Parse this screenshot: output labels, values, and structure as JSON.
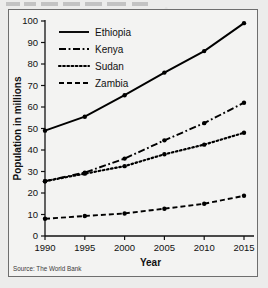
{
  "figure": {
    "source_note": "Source: The World Bank",
    "frame_color": "#6e6e6e",
    "background": "#f3f3f2",
    "line_color": "#000000"
  },
  "chart_data": {
    "type": "line",
    "title": "",
    "xlabel": "Year",
    "ylabel": "Population in millions",
    "x": [
      1990,
      1995,
      2000,
      2005,
      2010,
      2015
    ],
    "categories": [
      "1990",
      "1995",
      "2000",
      "2005",
      "2010",
      "2015"
    ],
    "xlim": [
      1990,
      2015
    ],
    "ylim": [
      0,
      100
    ],
    "yticks": [
      0,
      10,
      20,
      30,
      40,
      50,
      60,
      70,
      80,
      90,
      100
    ],
    "ytick_labels": [
      "0",
      "10",
      "20",
      "30",
      "40",
      "50",
      "60",
      "70",
      "80",
      "90",
      "100"
    ],
    "xticks": [
      1990,
      1995,
      2000,
      2005,
      2010,
      2015
    ],
    "xtick_labels": [
      "1990",
      "1995",
      "2000",
      "2005",
      "2010",
      "2015"
    ],
    "grid": false,
    "legend_position": "upper left",
    "series": [
      {
        "name": "Ethiopia",
        "style": "solid",
        "color": "#000000",
        "values": [
          49,
          55.5,
          65.5,
          76,
          86,
          99
        ]
      },
      {
        "name": "Kenya",
        "style": "dash-dot",
        "color": "#000000",
        "values": [
          25.5,
          29.5,
          36,
          44.5,
          52.5,
          62
        ]
      },
      {
        "name": "Sudan",
        "style": "dotted",
        "color": "#000000",
        "values": [
          25.5,
          29,
          32.5,
          38,
          42.5,
          48
        ]
      },
      {
        "name": "Zambia",
        "style": "dashed",
        "color": "#000000",
        "values": [
          8,
          9.3,
          10.5,
          12.7,
          15,
          18.7
        ]
      }
    ]
  }
}
